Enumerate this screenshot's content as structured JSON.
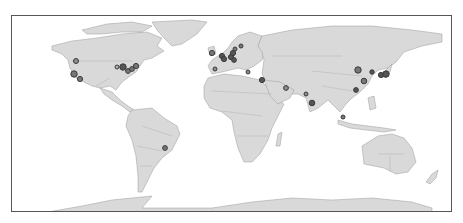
{
  "map": {
    "type": "world-choropleth-base",
    "land_color": "#d9d9d9",
    "border_color": "#9a9a9a",
    "frame_color": "#555555",
    "marker_fill": "#8c8c8c",
    "marker_stroke": "#3a3a3a"
  },
  "markers": [
    {
      "name": "Seattle",
      "x": 64,
      "y": 45,
      "r": 2.5,
      "fill": "#8c8c8c"
    },
    {
      "name": "San Francisco",
      "x": 62,
      "y": 58,
      "r": 3.2,
      "fill": "#777777"
    },
    {
      "name": "Los Angeles",
      "x": 68,
      "y": 63,
      "r": 2.6,
      "fill": "#777777"
    },
    {
      "name": "Chicago-west",
      "x": 105,
      "y": 51,
      "r": 2.0,
      "fill": "#b0b0b0"
    },
    {
      "name": "Chicago",
      "x": 111,
      "y": 51,
      "r": 3.2,
      "fill": "#555555"
    },
    {
      "name": "Pittsburgh",
      "x": 116,
      "y": 55,
      "r": 2.4,
      "fill": "#777777"
    },
    {
      "name": "Washington",
      "x": 120,
      "y": 53,
      "r": 2.4,
      "fill": "#777777"
    },
    {
      "name": "New York",
      "x": 124,
      "y": 50,
      "r": 2.6,
      "fill": "#777777"
    },
    {
      "name": "London",
      "x": 200,
      "y": 37,
      "r": 2.6,
      "fill": "#777777"
    },
    {
      "name": "Amsterdam",
      "x": 210,
      "y": 40,
      "r": 2.6,
      "fill": "#555555"
    },
    {
      "name": "Paris",
      "x": 212,
      "y": 43,
      "r": 2.6,
      "fill": "#555555"
    },
    {
      "name": "Frankfurt",
      "x": 219,
      "y": 41,
      "r": 2.6,
      "fill": "#555555"
    },
    {
      "name": "Berlin",
      "x": 221,
      "y": 37,
      "r": 2.6,
      "fill": "#555555"
    },
    {
      "name": "Zurich",
      "x": 222,
      "y": 44,
      "r": 2.4,
      "fill": "#555555"
    },
    {
      "name": "Stockholm",
      "x": 229,
      "y": 30,
      "r": 2.0,
      "fill": "#777777"
    },
    {
      "name": "Copenhagen",
      "x": 223,
      "y": 33,
      "r": 2.0,
      "fill": "#777777"
    },
    {
      "name": "Madrid",
      "x": 203,
      "y": 53,
      "r": 2.0,
      "fill": "#8c8c8c"
    },
    {
      "name": "Athens",
      "x": 236,
      "y": 56,
      "r": 2.0,
      "fill": "#8c8c8c"
    },
    {
      "name": "Tel Aviv",
      "x": 250,
      "y": 64,
      "r": 2.6,
      "fill": "#555555"
    },
    {
      "name": "Dubai",
      "x": 274,
      "y": 72,
      "r": 2.4,
      "fill": "#8c8c8c"
    },
    {
      "name": "Mumbai",
      "x": 294,
      "y": 78,
      "r": 2.0,
      "fill": "#8c8c8c"
    },
    {
      "name": "Bangalore",
      "x": 300,
      "y": 87,
      "r": 2.8,
      "fill": "#555555"
    },
    {
      "name": "Beijing",
      "x": 346,
      "y": 54,
      "r": 3.2,
      "fill": "#777777"
    },
    {
      "name": "Seoul",
      "x": 360,
      "y": 56,
      "r": 2.2,
      "fill": "#555555"
    },
    {
      "name": "Osaka",
      "x": 369,
      "y": 59,
      "r": 2.6,
      "fill": "#555555"
    },
    {
      "name": "Tokyo",
      "x": 374,
      "y": 58,
      "r": 3.2,
      "fill": "#555555"
    },
    {
      "name": "Shanghai",
      "x": 352,
      "y": 65,
      "r": 2.8,
      "fill": "#777777"
    },
    {
      "name": "Hong Kong",
      "x": 344,
      "y": 74,
      "r": 2.4,
      "fill": "#555555"
    },
    {
      "name": "Singapore",
      "x": 331,
      "y": 101,
      "r": 2.0,
      "fill": "#777777"
    },
    {
      "name": "Sao Paulo",
      "x": 153,
      "y": 132,
      "r": 2.4,
      "fill": "#777777"
    }
  ]
}
